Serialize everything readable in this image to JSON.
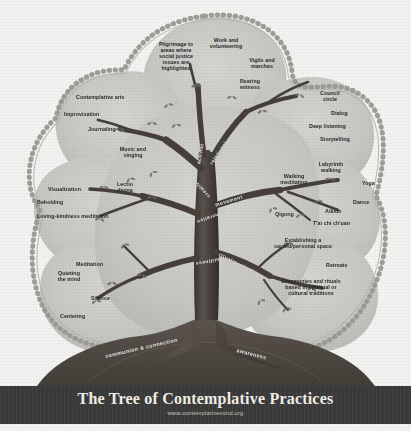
{
  "poster": {
    "title": "The Tree of Contemplative Practices",
    "url": "www.contemplativemind.org",
    "background_color": "#f3f3f1",
    "canopy_color": "#c9c9c5",
    "trunk_color": "#4a4440",
    "footer_color": "#3b3b3b"
  },
  "roots": [
    {
      "label": "communion & connection"
    },
    {
      "label": "awareness"
    }
  ],
  "branches": [
    {
      "name": "activist",
      "label": "activist"
    },
    {
      "name": "relational",
      "label": "relational"
    },
    {
      "name": "creative",
      "label": "creative"
    },
    {
      "name": "movement",
      "label": "movement"
    },
    {
      "name": "generative",
      "label": "generative"
    },
    {
      "name": "stillness",
      "label": "stillness"
    },
    {
      "name": "ritual-cyclical",
      "label": "ritual/cyclical"
    }
  ],
  "practices": {
    "activist": [
      "Pilgrimage to\nareas where\nsocial justice\nissues are\nhighlighted",
      "Work and\nvolunteering",
      "Vigils and\nmarches",
      "Bearing\nwitness"
    ],
    "creative": [
      "Contemplative arts",
      "Improvisation",
      "Journaling",
      "Music and\nsinging"
    ],
    "generative": [
      "Lectio\ndivina",
      "Visualization",
      "Beholding",
      "Loving-kindness meditation"
    ],
    "stillness": [
      "Meditation",
      "Quieting\nthe mind",
      "Silence",
      "Centering"
    ],
    "relational": [
      "Council\ncircle",
      "Dialog",
      "Deep listening",
      "Storytelling"
    ],
    "movement": [
      "Labyrinth\nwalking",
      "Walking\nmeditation",
      "Yoga",
      "Dance",
      "Aikido",
      "Qigong",
      "T'ai chi ch'uan"
    ],
    "ritual-cyclical": [
      "Establishing a\nsacred/personal space",
      "Retreats",
      "Ceremonies and rituals\nbased in spiritual or\ncultural traditions"
    ]
  }
}
